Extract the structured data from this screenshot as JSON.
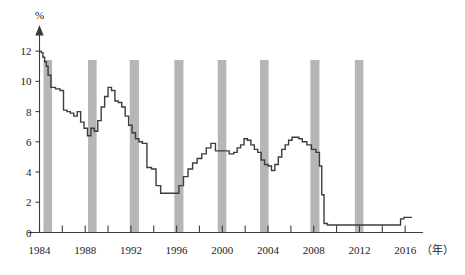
{
  "chart_data": {
    "type": "line",
    "title": "",
    "subtitle": "",
    "xlabel": "年",
    "ylabel": "%",
    "unit_label": "%",
    "year_caption": "（年）",
    "xlim": [
      1984,
      2016.6
    ],
    "ylim": [
      0,
      13.2
    ],
    "grid": false,
    "legend": "none",
    "y_ticks": [
      0,
      2,
      4,
      6,
      8,
      10,
      12
    ],
    "y_tick_labels": [
      "0",
      "2",
      "4",
      "6",
      "8",
      "10",
      "12"
    ],
    "x_tick_years": [
      1984,
      1986,
      1988,
      1990,
      1992,
      1994,
      1996,
      1998,
      2000,
      2002,
      2004,
      2006,
      2008,
      2010,
      2012,
      2014,
      2016
    ],
    "x_tick_labels_shown": [
      "1984",
      "1988",
      "1992",
      "1996",
      "2000",
      "2004",
      "2008",
      "2012",
      "2016"
    ],
    "x_labeled_years": [
      1984,
      1988,
      1992,
      1996,
      2000,
      2004,
      2008,
      2012,
      2016
    ],
    "series": [
      {
        "name": "policy-rate",
        "step": true,
        "x": [
          1984.0,
          1984.15,
          1984.3,
          1984.45,
          1984.6,
          1984.75,
          1985.0,
          1985.4,
          1985.8,
          1986.1,
          1986.4,
          1986.7,
          1987.0,
          1987.3,
          1987.6,
          1987.9,
          1988.2,
          1988.5,
          1988.8,
          1989.1,
          1989.4,
          1989.7,
          1990.0,
          1990.3,
          1990.6,
          1990.9,
          1991.2,
          1991.5,
          1991.8,
          1992.1,
          1992.4,
          1992.7,
          1993.0,
          1993.4,
          1993.8,
          1994.2,
          1994.6,
          1995.0,
          1995.4,
          1995.8,
          1996.2,
          1996.6,
          1997.0,
          1997.4,
          1997.8,
          1998.2,
          1998.6,
          1999.0,
          1999.4,
          1999.8,
          2000.2,
          2000.6,
          2001.0,
          2001.3,
          2001.6,
          2001.9,
          2002.2,
          2002.5,
          2002.8,
          2003.1,
          2003.4,
          2003.7,
          2004.0,
          2004.3,
          2004.6,
          2004.9,
          2005.2,
          2005.5,
          2005.8,
          2006.1,
          2006.4,
          2006.7,
          2007.0,
          2007.4,
          2007.8,
          2008.2,
          2008.5,
          2008.7,
          2008.9,
          2009.2,
          2010.0,
          2011.0,
          2012.0,
          2013.0,
          2014.0,
          2015.0,
          2015.6,
          2015.9,
          2016.4
        ],
        "y": [
          12.0,
          11.9,
          11.6,
          11.3,
          11.0,
          10.4,
          9.6,
          9.5,
          9.4,
          8.1,
          8.0,
          7.9,
          7.7,
          8.0,
          7.3,
          6.9,
          6.4,
          6.9,
          6.7,
          7.4,
          8.3,
          9.0,
          9.6,
          9.4,
          8.7,
          8.6,
          8.3,
          7.7,
          7.1,
          6.6,
          6.2,
          6.0,
          5.9,
          4.3,
          4.2,
          3.1,
          2.6,
          2.6,
          2.6,
          2.6,
          3.1,
          3.7,
          4.2,
          4.6,
          4.9,
          5.2,
          5.6,
          5.9,
          5.4,
          5.4,
          5.4,
          5.2,
          5.3,
          5.6,
          5.8,
          6.2,
          6.1,
          5.8,
          5.5,
          5.3,
          4.8,
          4.5,
          4.4,
          4.1,
          4.5,
          5.0,
          5.5,
          5.8,
          6.1,
          6.3,
          6.3,
          6.2,
          6.0,
          5.8,
          5.5,
          5.3,
          4.4,
          2.5,
          0.6,
          0.5,
          0.5,
          0.5,
          0.5,
          0.5,
          0.5,
          0.5,
          0.9,
          1.0,
          1.0
        ]
      }
    ],
    "recession_bands": [
      {
        "start": 1984.35,
        "end": 1985.1
      },
      {
        "start": 1988.25,
        "end": 1989.0
      },
      {
        "start": 1991.9,
        "end": 1992.7
      },
      {
        "start": 1995.8,
        "end": 1996.6
      },
      {
        "start": 1999.6,
        "end": 2000.35
      },
      {
        "start": 2003.3,
        "end": 2004.05
      },
      {
        "start": 2007.7,
        "end": 2008.5
      },
      {
        "start": 2011.6,
        "end": 2012.35
      }
    ],
    "annotations": []
  }
}
